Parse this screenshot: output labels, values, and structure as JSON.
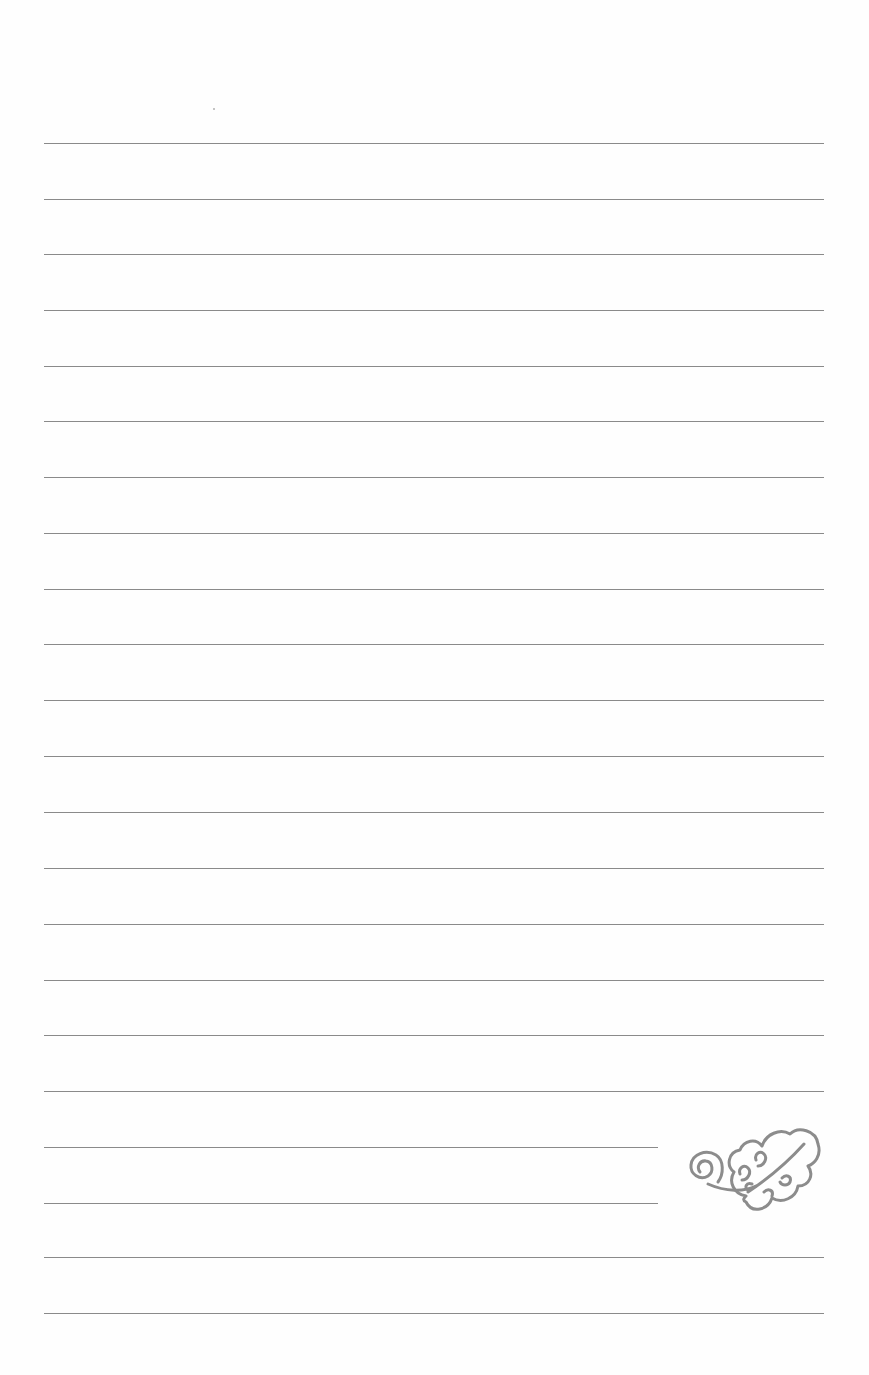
{
  "page": {
    "type": "lined-writing-paper",
    "background_color": "#fefefe",
    "rule_color": "#8a8a8a",
    "rule_count": 22,
    "rules": [
      {
        "y": 143,
        "x_end": 824
      },
      {
        "y": 199,
        "x_end": 824
      },
      {
        "y": 254,
        "x_end": 824
      },
      {
        "y": 310,
        "x_end": 824
      },
      {
        "y": 366,
        "x_end": 824
      },
      {
        "y": 421,
        "x_end": 824
      },
      {
        "y": 477,
        "x_end": 824
      },
      {
        "y": 533,
        "x_end": 824
      },
      {
        "y": 589,
        "x_end": 824
      },
      {
        "y": 644,
        "x_end": 824
      },
      {
        "y": 700,
        "x_end": 824
      },
      {
        "y": 756,
        "x_end": 824
      },
      {
        "y": 812,
        "x_end": 824
      },
      {
        "y": 868,
        "x_end": 824
      },
      {
        "y": 924,
        "x_end": 824
      },
      {
        "y": 980,
        "x_end": 824
      },
      {
        "y": 1035,
        "x_end": 824
      },
      {
        "y": 1091,
        "x_end": 824
      },
      {
        "y": 1147,
        "x_end": 658
      },
      {
        "y": 1203,
        "x_end": 658
      },
      {
        "y": 1257,
        "x_end": 824
      },
      {
        "y": 1313,
        "x_end": 824
      }
    ],
    "decoration": {
      "icon": "swirl-flourish-icon",
      "color": "#8c8c8c"
    }
  }
}
